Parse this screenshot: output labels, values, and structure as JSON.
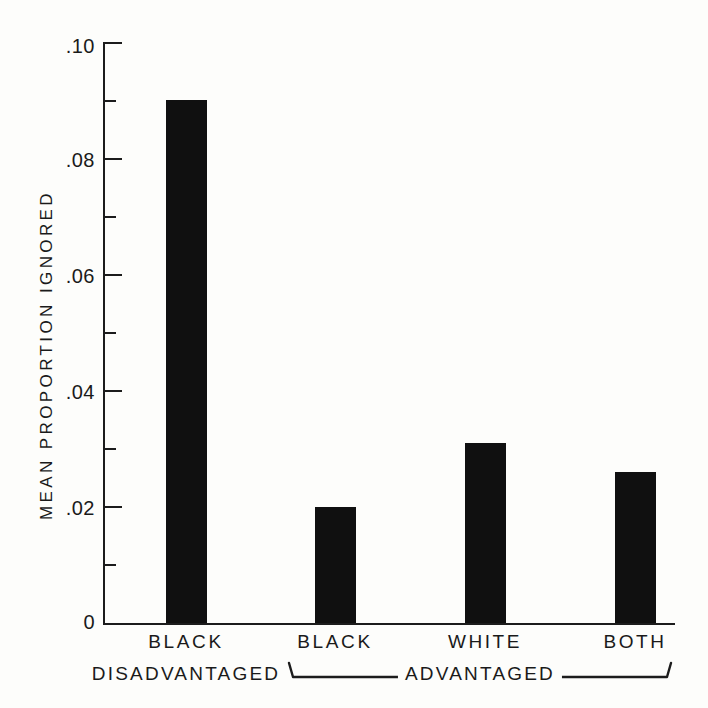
{
  "chart_data": {
    "type": "bar",
    "title": "",
    "xlabel": "",
    "ylabel": "MEAN PROPORTION IGNORED",
    "categories": [
      "BLACK",
      "BLACK",
      "WHITE",
      "BOTH"
    ],
    "category_sublabels": [
      "DISADVANTAGED",
      "",
      "",
      ""
    ],
    "values": [
      0.09,
      0.02,
      0.031,
      0.026
    ],
    "value_labels": [
      ".090",
      ".020",
      ".031",
      ".026"
    ],
    "ylim": [
      0,
      0.1
    ],
    "ytick_values": [
      0,
      0.02,
      0.04,
      0.06,
      0.08,
      0.1
    ],
    "ytick_labels": [
      "0",
      ".02",
      ".04",
      ".06",
      ".08",
      ".10"
    ],
    "yminor_tick_values": [
      0.01,
      0.03,
      0.05,
      0.07,
      0.09
    ],
    "grid": false,
    "legend": "none",
    "bar_color": "#101010",
    "axis_color": "#1c1c1c",
    "background_color": "#fdfdfb",
    "groups": [
      {
        "label": "ADVANTAGED",
        "members": [
          "BLACK",
          "WHITE",
          "BOTH"
        ],
        "bracket": true
      }
    ]
  },
  "axis": {
    "y_title": "MEAN PROPORTION IGNORED",
    "ticks": [
      {
        "label": ".10",
        "value": 0.1
      },
      {
        "label": ".08",
        "value": 0.08
      },
      {
        "label": ".06",
        "value": 0.06
      },
      {
        "label": ".04",
        "value": 0.04
      },
      {
        "label": ".02",
        "value": 0.02
      },
      {
        "label": "0",
        "value": 0
      }
    ]
  },
  "group_bracket": {
    "label": "ADVANTAGED"
  }
}
